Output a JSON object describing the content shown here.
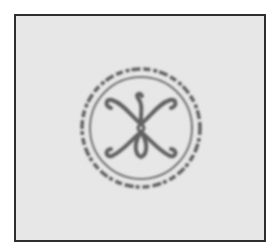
{
  "image": {
    "description": "Photograph of a faded circular ink stamp mark on a light gray background, framed by a thin dark border",
    "subject": "circular-seal-stamp",
    "ring_text": "",
    "ring_text_legible": false,
    "emblem": "symmetric scroll / fleur-like ornament with curled arms",
    "colors": {
      "background": "#e9e9e9",
      "ink": "#4a4a4a",
      "frame_border": "#2e2e2e",
      "page": "#ffffff"
    }
  }
}
